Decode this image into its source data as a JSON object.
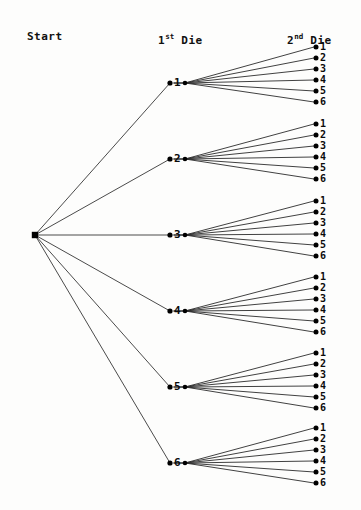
{
  "diagram": {
    "background_color": "#fdfdfc",
    "line_color": "#2b2b2b",
    "node_color": "#000000",
    "text_color": "#0b0b0b"
  },
  "headers": {
    "start": "Start",
    "first_die_prefix": "1",
    "first_die_sup": "st",
    "first_die_suffix": " Die",
    "second_die_prefix": "2",
    "second_die_sup": "nd",
    "second_die_suffix": " Die"
  },
  "chart_data": {
    "type": "diagram",
    "levels": [
      "Start",
      "1st Die",
      "2nd Die"
    ],
    "root": {
      "label": "",
      "x": 35,
      "y": 235
    },
    "branch_labels": [
      "1",
      "2",
      "3",
      "4",
      "5",
      "6"
    ],
    "leaf_labels": [
      "1",
      "2",
      "3",
      "4",
      "5",
      "6"
    ],
    "branch_count": 6,
    "leaves_per_branch": 6,
    "total_outcomes": 36,
    "branches": [
      {
        "label": "1",
        "dot_x": 170,
        "y": 83,
        "fan_x": 185,
        "leaves": [
          {
            "label": "1",
            "x": 316,
            "y": 47
          },
          {
            "label": "2",
            "x": 316,
            "y": 58
          },
          {
            "label": "3",
            "x": 316,
            "y": 69
          },
          {
            "label": "4",
            "x": 316,
            "y": 80
          },
          {
            "label": "5",
            "x": 316,
            "y": 91
          },
          {
            "label": "6",
            "x": 316,
            "y": 102
          }
        ]
      },
      {
        "label": "2",
        "dot_x": 170,
        "y": 159,
        "fan_x": 185,
        "leaves": [
          {
            "label": "1",
            "x": 316,
            "y": 124
          },
          {
            "label": "2",
            "x": 316,
            "y": 135
          },
          {
            "label": "3",
            "x": 316,
            "y": 146
          },
          {
            "label": "4",
            "x": 316,
            "y": 157
          },
          {
            "label": "5",
            "x": 316,
            "y": 168
          },
          {
            "label": "6",
            "x": 316,
            "y": 179
          }
        ]
      },
      {
        "label": "3",
        "dot_x": 170,
        "y": 235,
        "fan_x": 185,
        "leaves": [
          {
            "label": "1",
            "x": 316,
            "y": 201
          },
          {
            "label": "2",
            "x": 316,
            "y": 212
          },
          {
            "label": "3",
            "x": 316,
            "y": 223
          },
          {
            "label": "4",
            "x": 316,
            "y": 234
          },
          {
            "label": "5",
            "x": 316,
            "y": 245
          },
          {
            "label": "6",
            "x": 316,
            "y": 256
          }
        ]
      },
      {
        "label": "4",
        "dot_x": 170,
        "y": 311,
        "fan_x": 185,
        "leaves": [
          {
            "label": "1",
            "x": 316,
            "y": 277
          },
          {
            "label": "2",
            "x": 316,
            "y": 288
          },
          {
            "label": "3",
            "x": 316,
            "y": 299
          },
          {
            "label": "4",
            "x": 316,
            "y": 310
          },
          {
            "label": "5",
            "x": 316,
            "y": 321
          },
          {
            "label": "6",
            "x": 316,
            "y": 332
          }
        ]
      },
      {
        "label": "5",
        "dot_x": 170,
        "y": 387,
        "fan_x": 185,
        "leaves": [
          {
            "label": "1",
            "x": 316,
            "y": 353
          },
          {
            "label": "2",
            "x": 316,
            "y": 364
          },
          {
            "label": "3",
            "x": 316,
            "y": 375
          },
          {
            "label": "4",
            "x": 316,
            "y": 386
          },
          {
            "label": "5",
            "x": 316,
            "y": 397
          },
          {
            "label": "6",
            "x": 316,
            "y": 408
          }
        ]
      },
      {
        "label": "6",
        "dot_x": 170,
        "y": 463,
        "fan_x": 185,
        "leaves": [
          {
            "label": "1",
            "x": 316,
            "y": 428
          },
          {
            "label": "2",
            "x": 316,
            "y": 439
          },
          {
            "label": "3",
            "x": 316,
            "y": 450
          },
          {
            "label": "4",
            "x": 316,
            "y": 461
          },
          {
            "label": "5",
            "x": 316,
            "y": 472
          },
          {
            "label": "6",
            "x": 316,
            "y": 483
          }
        ]
      }
    ]
  }
}
